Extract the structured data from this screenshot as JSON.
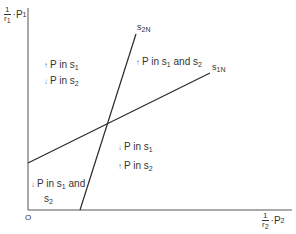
{
  "axes": {
    "y_label": {
      "num": "1",
      "den": "r",
      "den_sub": "1",
      "mult": "·P",
      "var_sub": "1"
    },
    "x_label": {
      "num": "1",
      "den": "r",
      "den_sub": "2",
      "mult": "·P",
      "var_sub": "2"
    },
    "origin": "O"
  },
  "lines": [
    {
      "name": "S1N",
      "base": "s",
      "sub": "1N",
      "x1": 28,
      "y1": 163,
      "x2": 210,
      "y2": 73
    },
    {
      "name": "S2N",
      "base": "s",
      "sub": "2N",
      "x1": 80,
      "y1": 210,
      "x2": 136,
      "y2": 34
    }
  ],
  "regions": {
    "left": {
      "line1": {
        "arrow": "↑",
        "text": "P in s",
        "sub": "1",
        "tail": ""
      },
      "line2": {
        "arrow": "↓",
        "text": "P in s",
        "sub": "2",
        "tail": ""
      }
    },
    "top_right": {
      "line1": {
        "arrow": "↑",
        "text": "P in s",
        "sub": "1",
        "mid": " and s",
        "sub2": "2"
      }
    },
    "bottom_right": {
      "line1": {
        "arrow": "↓",
        "text": "P in s",
        "sub": "1"
      },
      "line2": {
        "arrow": "↑",
        "text": "P in s",
        "sub": "2"
      }
    },
    "bottom_left": {
      "line1": {
        "arrow": "↓",
        "text": "P in s",
        "sub": "1",
        "mid": " and"
      },
      "line2": {
        "text": "s",
        "sub": "2"
      }
    }
  },
  "colors": {
    "line": "#2a2a2a",
    "axis": "#555555",
    "background": "#ffffff"
  }
}
